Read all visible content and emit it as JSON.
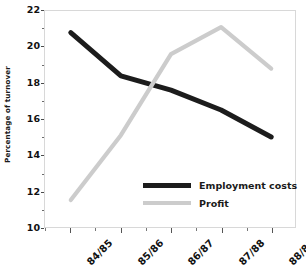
{
  "chart_data": {
    "type": "line",
    "title": "",
    "xlabel": "",
    "ylabel": "Percentage of turnover",
    "categories": [
      "84/85",
      "85/86",
      "86/87",
      "87/88",
      "88/89"
    ],
    "series": [
      {
        "name": "Employment costs",
        "color": "#1c1c1c",
        "values": [
          20.8,
          18.4,
          17.6,
          16.5,
          15.0
        ]
      },
      {
        "name": "Profit",
        "color": "#cccccc",
        "values": [
          11.5,
          15.1,
          19.6,
          21.1,
          18.8
        ]
      }
    ],
    "ylim": [
      10,
      22
    ],
    "y_ticks_major": [
      10,
      12,
      14,
      16,
      18,
      20,
      22
    ],
    "y_tick_labels": [
      "10",
      "12",
      "14",
      "16",
      "18",
      "20",
      "22"
    ],
    "y_ticks_minor": [
      11,
      13,
      15,
      17,
      19,
      21
    ],
    "grid": false,
    "legend_position": "inside-bottom-center",
    "frame_color": "#d8d8d8",
    "background": "#ffffff"
  },
  "legend": {
    "entries": [
      {
        "label": "Employment costs",
        "color": "#1c1c1c"
      },
      {
        "label": "Profit",
        "color": "#cccccc"
      }
    ]
  }
}
